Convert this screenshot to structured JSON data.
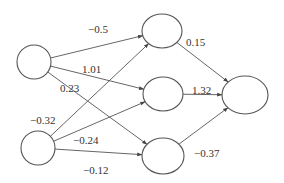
{
  "diagram": {
    "type": "neural-network",
    "colors": {
      "stroke": "#555555",
      "text": "#333333",
      "background": "#ffffff"
    },
    "nodes": [
      {
        "id": "in1",
        "layer": "input",
        "cx": 34,
        "cy": 62,
        "rx": 17,
        "ry": 17
      },
      {
        "id": "in2",
        "layer": "input",
        "cx": 38,
        "cy": 148,
        "rx": 17,
        "ry": 17
      },
      {
        "id": "h1",
        "layer": "hidden",
        "cx": 162,
        "cy": 31,
        "rx": 20,
        "ry": 17
      },
      {
        "id": "h2",
        "layer": "hidden",
        "cx": 163,
        "cy": 94,
        "rx": 20,
        "ry": 17
      },
      {
        "id": "h3",
        "layer": "hidden",
        "cx": 163,
        "cy": 156,
        "rx": 21,
        "ry": 18
      },
      {
        "id": "out",
        "layer": "output",
        "cx": 245,
        "cy": 95,
        "rx": 23,
        "ry": 19
      }
    ],
    "edges": [
      {
        "from": "in1",
        "to": "h1",
        "weight": "−0.5",
        "lx": 88,
        "ly": 33
      },
      {
        "from": "in1",
        "to": "h2",
        "weight": "1.01",
        "lx": 82,
        "ly": 73
      },
      {
        "from": "in1",
        "to": "h3",
        "weight": "0.23",
        "lx": 60,
        "ly": 92
      },
      {
        "from": "in2",
        "to": "h1",
        "weight": "−0.32",
        "lx": 30,
        "ly": 124
      },
      {
        "from": "in2",
        "to": "h2",
        "weight": "−0.24",
        "lx": 73,
        "ly": 144
      },
      {
        "from": "in2",
        "to": "h3",
        "weight": "−0.12",
        "lx": 83,
        "ly": 174
      },
      {
        "from": "h1",
        "to": "out",
        "weight": "0.15",
        "lx": 186,
        "ly": 46
      },
      {
        "from": "h2",
        "to": "out",
        "weight": "1.32",
        "lx": 192,
        "ly": 94
      },
      {
        "from": "h3",
        "to": "out",
        "weight": "−0.37",
        "lx": 194,
        "ly": 157
      }
    ]
  }
}
